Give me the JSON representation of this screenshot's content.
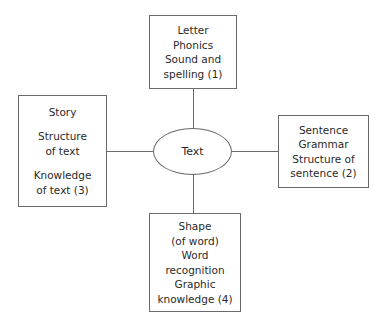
{
  "diagram": {
    "center": {
      "label": "Text"
    },
    "top": {
      "lines": [
        "Letter",
        "Phonics",
        "Sound and",
        "spelling (1)"
      ]
    },
    "right": {
      "lines": [
        "Sentence",
        "Grammar",
        "Structure of",
        "sentence (2)"
      ]
    },
    "left": {
      "group1": [
        "Story"
      ],
      "group2": [
        "Structure",
        "of text"
      ],
      "group3": [
        "Knowledge",
        "of text (3)"
      ]
    },
    "bottom": {
      "lines": [
        "Shape",
        "(of word)",
        "Word",
        "recognition",
        "Graphic",
        "knowledge (4)"
      ]
    }
  }
}
